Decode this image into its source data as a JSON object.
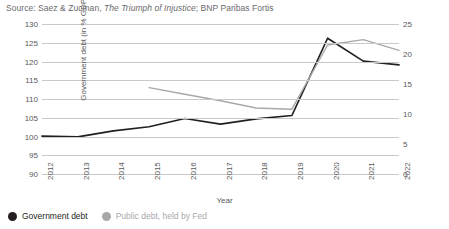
{
  "source": {
    "prefix": "Source: Saez & Zucman, ",
    "italic": "The Triumph of Injustice",
    "suffix": "; BNP Paribas Fortis"
  },
  "legend": {
    "items": [
      {
        "label": "Government debt",
        "color": "#231f20",
        "marker": "circle-marker"
      },
      {
        "label": "Public debt, held by Fed",
        "color": "#a8a8aa",
        "marker": "circle-marker"
      }
    ]
  },
  "chart_data": {
    "type": "line",
    "title": "",
    "xlabel": "Year",
    "ylabel": "Government debt (in % GDP)",
    "y2label": "Public debt (in % GDP)",
    "categories": [
      2012,
      2013,
      2014,
      2015,
      2016,
      2017,
      2018,
      2019,
      2020,
      2021,
      2022
    ],
    "ylim": [
      90,
      130
    ],
    "yticks": [
      90,
      95,
      100,
      105,
      110,
      115,
      120,
      125,
      130
    ],
    "y2lim": [
      0,
      25
    ],
    "y2ticks": [
      0,
      5,
      10,
      15,
      20,
      25
    ],
    "grid": true,
    "legend_position": "bottom-left",
    "series": [
      {
        "name": "Government debt",
        "axis": "left",
        "color": "#231f20",
        "values": [
          100.1,
          99.9,
          101.5,
          102.6,
          104.8,
          103.3,
          104.7,
          105.6,
          126.2,
          120.1,
          119.1
        ]
      },
      {
        "name": "Public debt, held by Fed",
        "axis": "right",
        "color": "#a8a8aa",
        "values": [
          null,
          null,
          null,
          14.4,
          13.3,
          12.2,
          11.0,
          10.8,
          21.5,
          22.4,
          20.6
        ]
      }
    ]
  }
}
